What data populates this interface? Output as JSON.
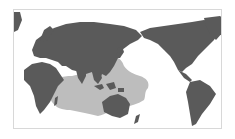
{
  "map": {
    "type": "world-map-pacific-centered",
    "projection": "equirectangular",
    "center_longitude": "Pacific (~150E)",
    "colors": {
      "background": "#ffffff",
      "land": "#5a5a5a",
      "range_highlight": "#bdbdbd",
      "frame_border": "#d8d8d8"
    },
    "layers": [
      {
        "name": "land",
        "description": "continents in dark gray"
      },
      {
        "name": "distribution-range",
        "description": "light gray shaded range over Indian Ocean, Southeast Asia, Australia and western tropical Pacific"
      }
    ],
    "range_extent": "East Africa coast to central Pacific; approx 30N to 35S"
  }
}
